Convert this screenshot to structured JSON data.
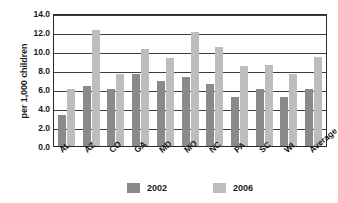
{
  "chart_data": {
    "type": "bar",
    "title": "",
    "subtitle": "",
    "xlabel": "",
    "ylabel": "per 1,000 children",
    "ylim": [
      0.0,
      14.0
    ],
    "ytick_step": 2.0,
    "ytick_labels": [
      "0.0",
      "2.0",
      "4.0",
      "6.0",
      "8.0",
      "10.0",
      "12.0",
      "14.0"
    ],
    "grid": "horizontal",
    "legend_position": "bottom-center",
    "categories": [
      "AL",
      "AZ",
      "CO",
      "GA",
      "MD",
      "MO",
      "NC",
      "PA",
      "SC",
      "WI",
      "Average"
    ],
    "series": [
      {
        "name": "2002",
        "color": "#8a8a8a",
        "values": [
          3.3,
          6.3,
          6.0,
          7.6,
          6.8,
          7.3,
          6.5,
          5.2,
          6.0,
          5.2,
          6.0
        ]
      },
      {
        "name": "2006",
        "color": "#bdbdbd",
        "values": [
          6.0,
          12.2,
          7.6,
          10.2,
          9.3,
          12.0,
          10.4,
          8.4,
          8.5,
          7.6,
          9.4
        ]
      }
    ]
  },
  "axis": {
    "y_title": "per 1,000 children"
  },
  "legend": {
    "entries": [
      {
        "label": "2002",
        "color": "#8a8a8a"
      },
      {
        "label": "2006",
        "color": "#bdbdbd"
      }
    ]
  },
  "colors": {
    "series_2002": "#8a8a8a",
    "series_2006": "#bdbdbd",
    "axis_line": "#2b2b2b",
    "gridline": "#3d3d3d",
    "text": "#1a1a1a",
    "background": "#ffffff"
  }
}
